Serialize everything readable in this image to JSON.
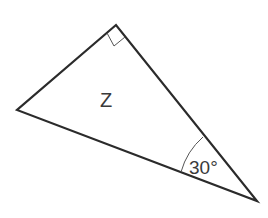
{
  "diagram": {
    "type": "right-triangle",
    "label": "Z",
    "angle_label": "30°",
    "right_angle_marker": true,
    "vertices": {
      "top": [
        116,
        25
      ],
      "left": [
        17,
        110
      ],
      "bottom_right": [
        257,
        201
      ]
    },
    "colors": {
      "stroke": "#2b2b2b",
      "arc": "#555555",
      "text": "#3a3a3a",
      "background": "#ffffff"
    }
  }
}
